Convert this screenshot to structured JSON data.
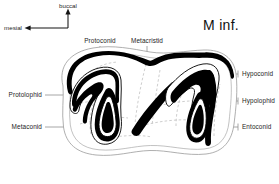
{
  "figure": {
    "title": "M inf."
  },
  "orientation": {
    "name": "orientation-compass",
    "up_label": "buccal",
    "left_label": "mesial"
  },
  "labels": {
    "top": [
      {
        "id": "protoconid",
        "text": "Protoconid"
      },
      {
        "id": "metacristid",
        "text": "Metacristid"
      }
    ],
    "left": [
      {
        "id": "protolophid",
        "text": "Protolophid"
      },
      {
        "id": "metaconid",
        "text": "Metaconid"
      }
    ],
    "right": [
      {
        "id": "hypoconid",
        "text": "Hypoconid"
      },
      {
        "id": "hypolophid",
        "text": "Hypolophid"
      },
      {
        "id": "entoconid",
        "text": "Entoconid"
      }
    ]
  },
  "colors": {
    "background": "#ffffff",
    "enamel": "#000000",
    "outline": "#9a9a9a",
    "leader": "#8a8a8a",
    "dashed": "#b4b4b4",
    "text": "#1d1d1d"
  }
}
